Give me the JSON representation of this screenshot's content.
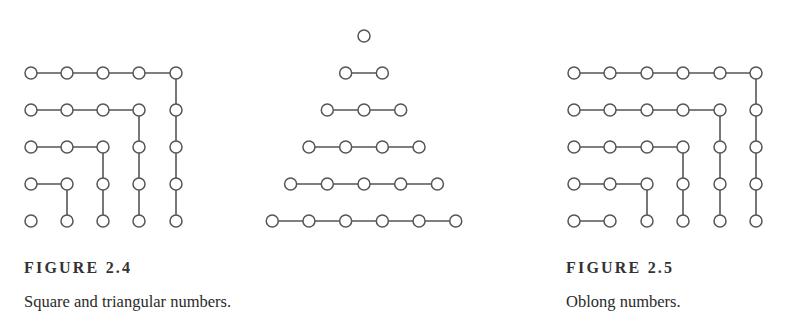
{
  "style": {
    "line_color": "#555555",
    "node_stroke": "#555555",
    "node_fill": "#ffffff",
    "node_radius": 6,
    "background": "#ffffff"
  },
  "figures": [
    {
      "id": "figure-2-4",
      "label": "FIGURE 2.4",
      "caption": "Square and triangular numbers.",
      "panels": [
        {
          "name": "square-numbers",
          "cols_x": [
            31,
            67,
            103,
            139,
            176
          ],
          "rows_y": [
            73,
            110,
            147,
            184,
            221
          ],
          "type": "gnomon"
        },
        {
          "name": "triangular-numbers",
          "type": "triangle",
          "apex_x": 364,
          "rows_y": [
            36,
            73,
            110,
            147,
            184,
            221
          ],
          "spacing": 36.7
        }
      ]
    },
    {
      "id": "figure-2-5",
      "label": "FIGURE 2.5",
      "caption": "Oblong numbers.",
      "panels": [
        {
          "name": "oblong-numbers",
          "cols_x": [
            574,
            610,
            647,
            683,
            720,
            756
          ],
          "rows_y": [
            73,
            110,
            147,
            184,
            221
          ],
          "type": "gnomon"
        }
      ]
    }
  ]
}
